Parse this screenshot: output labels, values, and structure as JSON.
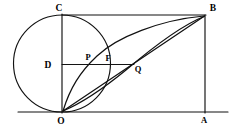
{
  "figure": {
    "background_color": "#ffffff",
    "line_color": "#111111",
    "label_color": "#000000",
    "width": 233,
    "height": 129
  },
  "labels": {
    "C": "C",
    "B": "B",
    "D": "D",
    "P": "P",
    "F": "F",
    "Q": "Q",
    "O": "O",
    "A": "A"
  },
  "points": [
    {
      "name": "C",
      "label": "C",
      "x": 62,
      "y": 15,
      "label_x": 59,
      "label_y": 11
    },
    {
      "name": "B",
      "label": "B",
      "x": 205,
      "y": 15,
      "label_x": 210,
      "label_y": 11
    },
    {
      "name": "D",
      "label": "D",
      "x": 62,
      "y": 64,
      "label_x": 46,
      "label_y": 67
    },
    {
      "name": "P",
      "label": "P",
      "x": 89,
      "y": 64,
      "label_x": 85,
      "label_y": 59
    },
    {
      "name": "F",
      "label": "F",
      "x": 110,
      "y": 64,
      "label_x": 105,
      "label_y": 60
    },
    {
      "name": "Q",
      "label": "Q",
      "x": 133,
      "y": 70,
      "label_x": 136,
      "label_y": 70
    },
    {
      "name": "O",
      "label": "O",
      "x": 62,
      "y": 112,
      "label_x": 59,
      "label_y": 123
    },
    {
      "name": "A",
      "label": "A",
      "x": 205,
      "y": 112,
      "label_x": 202,
      "label_y": 122
    }
  ],
  "circle": {
    "name": "tangent-circle",
    "center_x": 62,
    "center_y": 63.5,
    "radius": 48.5
  },
  "segments": [
    {
      "name": "segment-CB",
      "from": "C",
      "to": "B"
    },
    {
      "name": "segment-CO",
      "from": "C",
      "to": "O"
    },
    {
      "name": "segment-BA",
      "from": "B",
      "to": "A"
    },
    {
      "name": "segment-OA-baseline",
      "from": "O",
      "to": "A"
    },
    {
      "name": "segment-DF-chord",
      "from": "D",
      "to": "Q"
    },
    {
      "name": "segment-OB-diagonal",
      "from": "O",
      "to": "B"
    }
  ],
  "curves": [
    {
      "name": "arc-upper-O-to-B",
      "from": "O",
      "to": "B"
    },
    {
      "name": "arc-lower-O-to-B",
      "from": "O",
      "to": "B"
    }
  ]
}
